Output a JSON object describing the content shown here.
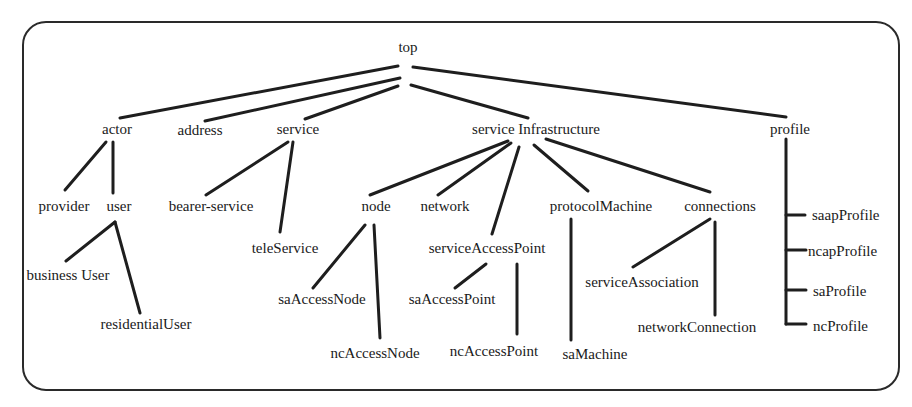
{
  "diagram": {
    "type": "tree",
    "nodes": [
      {
        "id": "top",
        "label": "top",
        "x": 408,
        "y": 38,
        "align": "center"
      },
      {
        "id": "actor",
        "label": "actor",
        "x": 117,
        "y": 120,
        "align": "center"
      },
      {
        "id": "address",
        "label": "address",
        "x": 200,
        "y": 121,
        "align": "center"
      },
      {
        "id": "service",
        "label": "service",
        "x": 298,
        "y": 120,
        "align": "center"
      },
      {
        "id": "serviceInfrastructure",
        "label": "service Infrastructure",
        "x": 536,
        "y": 120,
        "align": "center"
      },
      {
        "id": "profile",
        "label": "profile",
        "x": 790,
        "y": 120,
        "align": "center"
      },
      {
        "id": "provider",
        "label": "provider",
        "x": 64,
        "y": 197,
        "align": "center"
      },
      {
        "id": "user",
        "label": "user",
        "x": 119,
        "y": 197,
        "align": "center"
      },
      {
        "id": "bearerService",
        "label": "bearer-service",
        "x": 211,
        "y": 197,
        "align": "center"
      },
      {
        "id": "teleService",
        "label": "teleService",
        "x": 285,
        "y": 239,
        "align": "center"
      },
      {
        "id": "businessUser",
        "label": "business User",
        "x": 68,
        "y": 266,
        "align": "center"
      },
      {
        "id": "residentialUser",
        "label": "residentialUser",
        "x": 146,
        "y": 315,
        "align": "center"
      },
      {
        "id": "node",
        "label": "node",
        "x": 376,
        "y": 197,
        "align": "center"
      },
      {
        "id": "network",
        "label": "network",
        "x": 445,
        "y": 197,
        "align": "center"
      },
      {
        "id": "protocolMachine",
        "label": "protocolMachine",
        "x": 601,
        "y": 197,
        "align": "center"
      },
      {
        "id": "connections",
        "label": "connections",
        "x": 720,
        "y": 197,
        "align": "center"
      },
      {
        "id": "serviceAccessPoint",
        "label": "serviceAccessPoint",
        "x": 487,
        "y": 239,
        "align": "center"
      },
      {
        "id": "saAccessNode",
        "label": "saAccessNode",
        "x": 322,
        "y": 290,
        "align": "center"
      },
      {
        "id": "saAccessPoint",
        "label": "saAccessPoint",
        "x": 452,
        "y": 290,
        "align": "center"
      },
      {
        "id": "ncAccessNode",
        "label": "ncAccessNode",
        "x": 375,
        "y": 344,
        "align": "center"
      },
      {
        "id": "ncAccessPoint",
        "label": "ncAccessPoint",
        "x": 494,
        "y": 342,
        "align": "center"
      },
      {
        "id": "saMachine",
        "label": "saMachine",
        "x": 595,
        "y": 345,
        "align": "center"
      },
      {
        "id": "serviceAssociation",
        "label": "serviceAssociation",
        "x": 642,
        "y": 273,
        "align": "center"
      },
      {
        "id": "networkConnection",
        "label": "networkConnection",
        "x": 697,
        "y": 318,
        "align": "center"
      },
      {
        "id": "saapProfile",
        "label": "saapProfile",
        "x": 812,
        "y": 206,
        "align": "left"
      },
      {
        "id": "ncapProfile",
        "label": "ncapProfile",
        "x": 808,
        "y": 242,
        "align": "left"
      },
      {
        "id": "saProfile",
        "label": "saProfile",
        "x": 813,
        "y": 282,
        "align": "left"
      },
      {
        "id": "ncProfile",
        "label": "ncProfile",
        "x": 813,
        "y": 317,
        "align": "left"
      }
    ],
    "edges": [
      {
        "from": "top",
        "to": "actor",
        "x1": 398,
        "y1": 66,
        "x2": 120,
        "y2": 118
      },
      {
        "from": "top",
        "to": "address",
        "x1": 400,
        "y1": 78,
        "x2": 205,
        "y2": 121
      },
      {
        "from": "top",
        "to": "service",
        "x1": 398,
        "y1": 86,
        "x2": 305,
        "y2": 119
      },
      {
        "from": "top",
        "to": "serviceInfrastructure",
        "x1": 411,
        "y1": 85,
        "x2": 528,
        "y2": 118
      },
      {
        "from": "top",
        "to": "profile",
        "x1": 413,
        "y1": 67,
        "x2": 786,
        "y2": 117
      },
      {
        "from": "actor",
        "to": "provider",
        "x1": 106,
        "y1": 142,
        "x2": 65,
        "y2": 190
      },
      {
        "from": "actor",
        "to": "user",
        "x1": 113,
        "y1": 142,
        "x2": 113,
        "y2": 193
      },
      {
        "from": "service",
        "to": "bearerService",
        "x1": 288,
        "y1": 142,
        "x2": 206,
        "y2": 195
      },
      {
        "from": "service",
        "to": "teleService",
        "x1": 293,
        "y1": 142,
        "x2": 280,
        "y2": 232
      },
      {
        "from": "user",
        "to": "businessUser",
        "x1": 115,
        "y1": 222,
        "x2": 66,
        "y2": 261
      },
      {
        "from": "user",
        "to": "residentialUser",
        "x1": 115,
        "y1": 222,
        "x2": 140,
        "y2": 313
      },
      {
        "from": "serviceInfrastructure",
        "to": "node",
        "x1": 508,
        "y1": 141,
        "x2": 370,
        "y2": 195
      },
      {
        "from": "serviceInfrastructure",
        "to": "network",
        "x1": 511,
        "y1": 143,
        "x2": 438,
        "y2": 195
      },
      {
        "from": "serviceInfrastructure",
        "to": "serviceAccessPoint",
        "x1": 519,
        "y1": 147,
        "x2": 492,
        "y2": 234
      },
      {
        "from": "serviceInfrastructure",
        "to": "protocolMachine",
        "x1": 534,
        "y1": 145,
        "x2": 588,
        "y2": 191
      },
      {
        "from": "serviceInfrastructure",
        "to": "connections",
        "x1": 546,
        "y1": 139,
        "x2": 710,
        "y2": 192
      },
      {
        "from": "node",
        "to": "saAccessNode",
        "x1": 365,
        "y1": 225,
        "x2": 313,
        "y2": 288
      },
      {
        "from": "node",
        "to": "ncAccessNode",
        "x1": 374,
        "y1": 225,
        "x2": 380,
        "y2": 338
      },
      {
        "from": "serviceAccessPoint",
        "to": "saAccessPoint",
        "x1": 486,
        "y1": 264,
        "x2": 455,
        "y2": 288
      },
      {
        "from": "serviceAccessPoint",
        "to": "ncAccessPoint",
        "x1": 517,
        "y1": 264,
        "x2": 517,
        "y2": 334
      },
      {
        "from": "protocolMachine",
        "to": "saMachine",
        "x1": 571,
        "y1": 219,
        "x2": 571,
        "y2": 340
      },
      {
        "from": "connections",
        "to": "serviceAssociation",
        "x1": 710,
        "y1": 219,
        "x2": 633,
        "y2": 267
      },
      {
        "from": "connections",
        "to": "networkConnection",
        "x1": 715,
        "y1": 222,
        "x2": 715,
        "y2": 315
      }
    ],
    "bracket": {
      "parent": "profile",
      "spine_x": 786,
      "spine_top": 139,
      "spine_bottom": 324,
      "ticks": [
        {
          "to": "saapProfile",
          "y": 215,
          "x2": 805
        },
        {
          "to": "ncapProfile",
          "y": 250,
          "x2": 806
        },
        {
          "to": "saProfile",
          "y": 290,
          "x2": 806
        },
        {
          "to": "ncProfile",
          "y": 324,
          "x2": 806
        }
      ]
    }
  }
}
